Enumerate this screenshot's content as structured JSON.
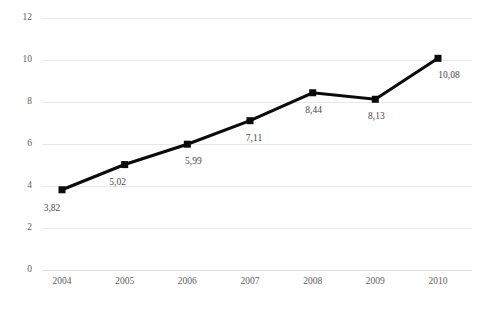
{
  "chart_data": {
    "type": "line",
    "title": "",
    "subtitle": "",
    "xlabel": "",
    "ylabel": "",
    "categories": [
      "2004",
      "2005",
      "2006",
      "2007",
      "2008",
      "2009",
      "2010"
    ],
    "values": [
      3.82,
      5.02,
      5.99,
      7.11,
      8.44,
      8.13,
      10.08
    ],
    "point_labels": [
      "3,82",
      "5,02",
      "5,99",
      "7,11",
      "8,44",
      "8,13",
      "10,08"
    ],
    "ylim": [
      0,
      12
    ],
    "ytick_values": [
      0,
      2,
      4,
      6,
      8,
      10,
      12
    ],
    "ytick_labels": [
      "0",
      "2",
      "4",
      "6",
      "8",
      "10",
      "12"
    ],
    "grid": true,
    "grid_axis": "y",
    "legend": false,
    "legend_position": "none",
    "series": [
      {
        "name": "",
        "values": [
          3.82,
          5.02,
          5.99,
          7.11,
          8.44,
          8.13,
          10.08
        ],
        "color": "#0b0b0b",
        "marker": "square"
      }
    ],
    "colors": {
      "line": "#0b0b0b",
      "marker": "#0b0b0b",
      "grid": "#e8e8e8",
      "tick_text": "#5e5e5e",
      "label_text": "#4a4a4a",
      "background": "#ffffff"
    }
  }
}
